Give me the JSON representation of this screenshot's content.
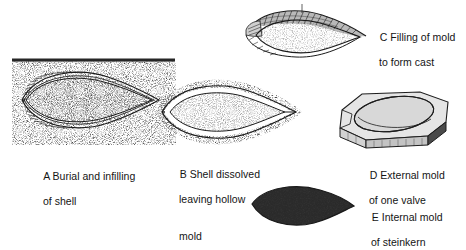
{
  "figure": {
    "background_color": "#ffffff",
    "ink_color": "#1a1a1a",
    "width": 466,
    "height": 239
  },
  "panels": [
    {
      "id": "A",
      "name": "burial-and-infilling",
      "letter": "A",
      "caption_line1": "A Burial and infilling",
      "caption_line2": "of shell",
      "illustration": "shell-buried-in-sediment-with-sediment-fill",
      "features": [
        "sediment-surface-line",
        "stippled-sediment-matrix",
        "ribbed-shell-valves",
        "stippled-internal-fill"
      ]
    },
    {
      "id": "B",
      "name": "shell-dissolved-hollow-mold",
      "letter": "B",
      "caption_line1": "B Shell dissolved",
      "caption_line2": "leaving hollow",
      "caption_line3": "mold",
      "illustration": "hollow-white-void-between-sediment-and-internal-fill",
      "features": [
        "white-void-gap",
        "stippled-internal-fill",
        "outline-of-former-shell"
      ]
    },
    {
      "id": "C",
      "name": "filling-of-mold-to-form-cast",
      "letter": "C",
      "caption_line1": "C Filling of mold",
      "caption_line2": "to form cast",
      "illustration": "mold-filled-with-sediment-forming-cast",
      "features": [
        "cast-shell-shell-layer",
        "stippled-internal-fill"
      ]
    },
    {
      "id": "D",
      "name": "external-mold-of-one-valve",
      "letter": "D",
      "caption_line1": "D External mold",
      "caption_line2": "of one valve",
      "illustration": "three-dimensional-rock-block-with-oval-impression",
      "features": [
        "rock-block",
        "oval-impression",
        "shaded-side-face"
      ]
    },
    {
      "id": "E",
      "name": "internal-mold-steinkern",
      "letter": "E",
      "caption_line1": "E Internal mold",
      "caption_line2": "of steinkern",
      "illustration": "solid-stippled-teardrop-steinkern",
      "features": [
        "dense-stipple-fill",
        "teardrop-outline"
      ]
    }
  ]
}
